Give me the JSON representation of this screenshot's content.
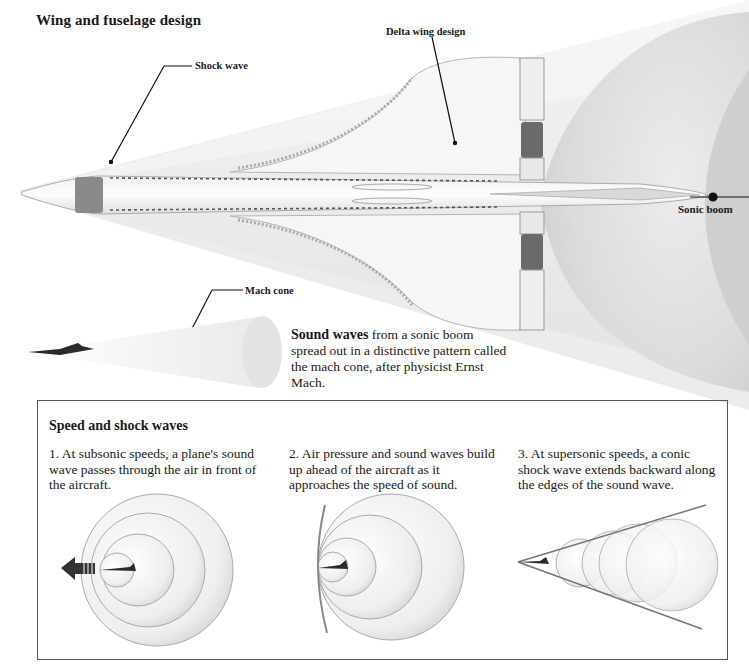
{
  "header": {
    "title": "Wing and fuselage design"
  },
  "labels": {
    "delta_wing": "Delta wing design",
    "shock_wave": "Shock wave",
    "sonic_boom": "Sonic boom",
    "mach_cone": "Mach cone"
  },
  "caption": {
    "bold": "Sound waves",
    "text": " from a sonic boom spread out in a distinctive pattern called the mach cone, after physicist Ernst Mach."
  },
  "panel": {
    "title": "Speed and shock waves",
    "steps": [
      {
        "number": "1.",
        "text": "1. At subsonic speeds, a plane's sound wave passes through the air in front of the aircraft."
      },
      {
        "number": "2.",
        "text": "2. Air pressure and sound waves build up ahead of the aircraft as it approaches the speed of sound."
      },
      {
        "number": "3.",
        "text": "3. At supersonic speeds, a conic shock wave extends backward along the edges of the sound wave."
      }
    ]
  },
  "icons": {
    "direction_arrow": "arrow-left-icon",
    "aircraft": "aircraft-silhouette-icon"
  },
  "colors": {
    "background": "#ffffff",
    "cone_shade": "#e6e6e6",
    "sphere_shade": "#d9d9d9",
    "line": "#1a1a1a",
    "box_border": "#555555"
  }
}
